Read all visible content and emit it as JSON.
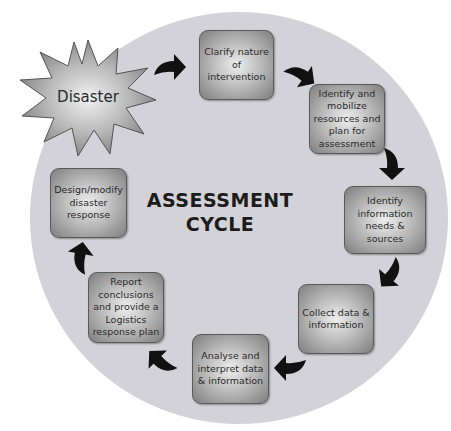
{
  "diagram": {
    "title_line1": "ASSESSMENT",
    "title_line2": "CYCLE",
    "trigger": {
      "label": "Disaster",
      "shape": "starburst"
    },
    "steps": [
      {
        "id": 1,
        "label": "Clarify nature of intervention"
      },
      {
        "id": 2,
        "label": "Identify and mobilize resources and plan for assessment"
      },
      {
        "id": 3,
        "label": "Identify information needs & sources"
      },
      {
        "id": 4,
        "label": "Collect data & information"
      },
      {
        "id": 5,
        "label": "Analyse and interpret data & information"
      },
      {
        "id": 6,
        "label": "Report conclusions and provide a Logistics response plan"
      },
      {
        "id": 7,
        "label": "Design/modify disaster response"
      }
    ],
    "arrows": [
      "curved-arrow-icon",
      "curved-arrow-icon",
      "curved-arrow-icon",
      "curved-arrow-icon",
      "curved-arrow-icon",
      "curved-arrow-icon",
      "curved-arrow-icon"
    ],
    "colors": {
      "circle": "#d2d2d8",
      "box_edge": "#7e7e7e",
      "box_center": "#eeeeee",
      "arrow": "#111111",
      "text": "#2a2a2a"
    }
  }
}
